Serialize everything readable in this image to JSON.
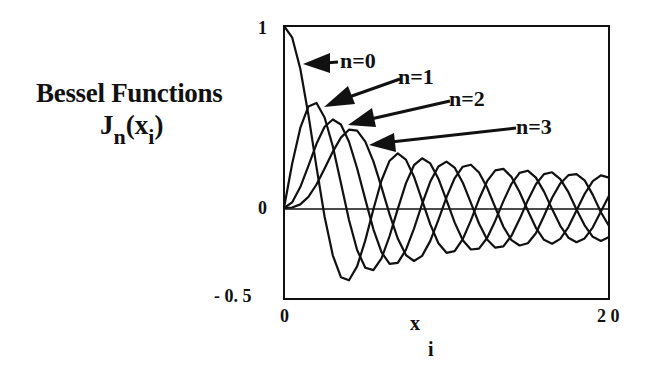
{
  "title": "Bessel Functions",
  "ylabel": {
    "main": "J",
    "sub_n": "n",
    "open": "(x",
    "sub_i": "i",
    "close": ")"
  },
  "xlabel": {
    "main": "x",
    "sub": "i"
  },
  "yticks": [
    "1",
    "0",
    "- 0. 5"
  ],
  "xticks": [
    "0",
    "2 0"
  ],
  "annotations": [
    {
      "label": "n=0"
    },
    {
      "label": "n=1"
    },
    {
      "label": "n=2"
    },
    {
      "label": "n=3"
    }
  ],
  "chart_data": {
    "type": "line",
    "title": "Bessel Functions",
    "xlabel": "x_i",
    "ylabel": "J_n(x_i)",
    "xlim": [
      0,
      20
    ],
    "ylim": [
      -0.5,
      1
    ],
    "xticks": [
      0,
      20
    ],
    "yticks": [
      -0.5,
      0,
      1
    ],
    "grid": false,
    "legend": "arrow annotations n=0..3 pointing to curves",
    "x": [
      0,
      0.5,
      1,
      1.5,
      2,
      2.5,
      3,
      3.5,
      4,
      4.5,
      5,
      5.5,
      6,
      6.5,
      7,
      7.5,
      8,
      8.5,
      9,
      9.5,
      10,
      10.5,
      11,
      11.5,
      12,
      12.5,
      13,
      13.5,
      14,
      14.5,
      15,
      15.5,
      16,
      16.5,
      17,
      17.5,
      18,
      18.5,
      19,
      19.5,
      20
    ],
    "series": [
      {
        "name": "n=0",
        "values": [
          1,
          0.938,
          0.765,
          0.512,
          0.224,
          -0.048,
          -0.26,
          -0.38,
          -0.397,
          -0.321,
          -0.178,
          -0.007,
          0.151,
          0.26,
          0.3,
          0.266,
          0.172,
          0.042,
          -0.09,
          -0.194,
          -0.246,
          -0.237,
          -0.171,
          -0.068,
          0.048,
          0.147,
          0.207,
          0.215,
          0.171,
          0.088,
          -0.014,
          -0.109,
          -0.175,
          -0.196,
          -0.17,
          -0.105,
          -0.014,
          0.077,
          0.147,
          0.179,
          0.167
        ]
      },
      {
        "name": "n=1",
        "values": [
          0,
          0.242,
          0.44,
          0.558,
          0.577,
          0.497,
          0.339,
          0.137,
          -0.066,
          -0.231,
          -0.328,
          -0.341,
          -0.277,
          -0.154,
          -0.005,
          0.135,
          0.235,
          0.273,
          0.245,
          0.161,
          0.043,
          -0.079,
          -0.177,
          -0.228,
          -0.223,
          -0.165,
          -0.07,
          0.038,
          0.133,
          0.193,
          0.205,
          0.167,
          0.09,
          -0.006,
          -0.098,
          -0.163,
          -0.188,
          -0.167,
          -0.106,
          -0.02,
          0.067
        ]
      },
      {
        "name": "n=2",
        "values": [
          0,
          0.031,
          0.115,
          0.232,
          0.353,
          0.446,
          0.486,
          0.459,
          0.364,
          0.218,
          0.047,
          -0.117,
          -0.243,
          -0.307,
          -0.301,
          -0.23,
          -0.113,
          0.022,
          0.145,
          0.228,
          0.255,
          0.222,
          0.139,
          0.028,
          -0.085,
          -0.173,
          -0.218,
          -0.211,
          -0.152,
          -0.061,
          0.042,
          0.131,
          0.186,
          0.196,
          0.158,
          0.087,
          -0.008,
          -0.095,
          -0.158,
          -0.181,
          -0.16
        ]
      },
      {
        "name": "n=3",
        "values": [
          0,
          0.003,
          0.02,
          0.061,
          0.129,
          0.217,
          0.309,
          0.387,
          0.43,
          0.425,
          0.365,
          0.256,
          0.115,
          -0.035,
          -0.168,
          -0.259,
          -0.291,
          -0.263,
          -0.181,
          -0.065,
          0.058,
          0.163,
          0.227,
          0.238,
          0.195,
          0.112,
          0.003,
          -0.103,
          -0.177,
          -0.206,
          -0.194,
          -0.139,
          -0.044,
          0.056,
          0.135,
          0.18,
          0.186,
          0.152,
          0.072,
          -0.023,
          -0.099
        ]
      }
    ],
    "style": {
      "line_color": "#111111",
      "background": "#ffffff"
    }
  }
}
